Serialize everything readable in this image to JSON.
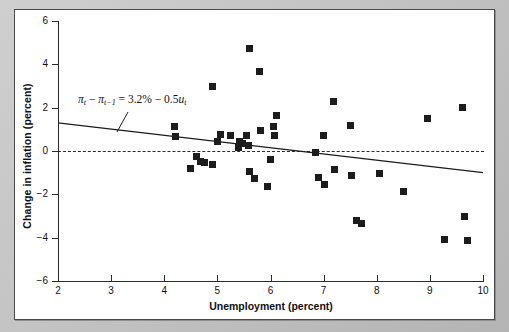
{
  "figure": {
    "background_color": "#c2c2c2",
    "panel_color": "#ffffff",
    "border_color": "#4a4a4a",
    "marker_color": "#1c1c1c"
  },
  "annotation": {
    "equation_text": "πt − πt−1 = 3.2% − 0.5ut",
    "leader_note": "leader line from equation to regression line"
  },
  "chart_data": {
    "type": "scatter",
    "title": "",
    "xlabel": "Unemployment (percent)",
    "ylabel": "Change in inflation (percent)",
    "xlim": [
      2,
      10
    ],
    "ylim": [
      -6,
      6
    ],
    "xticks": [
      2,
      3,
      4,
      5,
      6,
      7,
      8,
      9,
      10
    ],
    "yticks": [
      6,
      4,
      2,
      0,
      -2,
      -4,
      -6
    ],
    "xticklabels": [
      "2",
      "3",
      "4",
      "5",
      "6",
      "7",
      "8",
      "9",
      "10"
    ],
    "yticklabels": [
      "6",
      "4",
      "2",
      "0",
      "−2",
      "−4",
      "−6"
    ],
    "grid": false,
    "legend": null,
    "reference_lines": [
      {
        "name": "zero-line",
        "type": "horizontal-dashed",
        "y": 0
      }
    ],
    "fit_line": {
      "name": "regression-line",
      "label": "πt − πt−1 = 3.2% − 0.5ut",
      "intercept": 3.2,
      "slope": -0.5,
      "drawn_endpoints": [
        [
          2,
          1.3
        ],
        [
          10,
          -1.0
        ]
      ]
    },
    "points": [
      [
        4.2,
        1.15
      ],
      [
        4.22,
        0.65
      ],
      [
        4.5,
        -0.8
      ],
      [
        4.6,
        -0.25
      ],
      [
        4.68,
        -0.48
      ],
      [
        4.75,
        -0.55
      ],
      [
        4.9,
        -0.6
      ],
      [
        4.9,
        3.0
      ],
      [
        5.0,
        0.45
      ],
      [
        5.05,
        0.75
      ],
      [
        5.25,
        0.7
      ],
      [
        5.4,
        0.15
      ],
      [
        5.42,
        0.45
      ],
      [
        5.48,
        0.35
      ],
      [
        5.55,
        0.7
      ],
      [
        5.58,
        0.25
      ],
      [
        5.6,
        4.75
      ],
      [
        5.6,
        -0.95
      ],
      [
        5.7,
        -1.25
      ],
      [
        5.8,
        3.65
      ],
      [
        5.82,
        0.95
      ],
      [
        5.95,
        -1.65
      ],
      [
        6.0,
        -0.4
      ],
      [
        6.05,
        1.15
      ],
      [
        6.08,
        0.7
      ],
      [
        6.12,
        1.65
      ],
      [
        6.85,
        -0.05
      ],
      [
        6.9,
        -1.2
      ],
      [
        7.0,
        0.7
      ],
      [
        7.02,
        -1.55
      ],
      [
        7.18,
        2.3
      ],
      [
        7.2,
        -0.85
      ],
      [
        7.5,
        1.2
      ],
      [
        7.52,
        -1.15
      ],
      [
        7.62,
        -3.2
      ],
      [
        7.72,
        -3.35
      ],
      [
        8.05,
        -1.05
      ],
      [
        8.5,
        -1.85
      ],
      [
        8.95,
        1.5
      ],
      [
        9.28,
        -4.1
      ],
      [
        9.62,
        2.0
      ],
      [
        9.65,
        -3.0
      ],
      [
        9.7,
        -4.15
      ]
    ]
  }
}
